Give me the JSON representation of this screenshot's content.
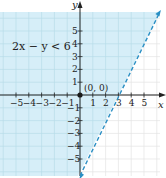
{
  "chart_data": {
    "type": "line",
    "title": "",
    "inequality_label": "2x − y < 6",
    "xlabel": "x",
    "ylabel": "y",
    "xlim": [
      -6,
      6
    ],
    "ylim": [
      -6,
      6
    ],
    "x_ticks": [
      -5,
      -4,
      -3,
      -2,
      -1,
      1,
      2,
      3,
      4,
      5
    ],
    "y_ticks": [
      -5,
      -4,
      -3,
      -2,
      -1,
      1,
      2,
      3,
      4,
      5
    ],
    "x_tick_labels": [
      "−5",
      "−4",
      "−3",
      "−2",
      "−1",
      "1",
      "2",
      "3",
      "4",
      "5"
    ],
    "y_tick_labels": [
      "−5",
      "−4",
      "−3",
      "−2",
      "−1",
      "1",
      "2",
      "3",
      "4",
      "5"
    ],
    "grid": true,
    "boundary_line": {
      "equation": "y = 2x − 6",
      "style": "dashed",
      "points": [
        [
          0,
          -6
        ],
        [
          3,
          0
        ],
        [
          6,
          6
        ]
      ],
      "x_intercept": 3,
      "y_intercept": -6
    },
    "shaded_region": "left/above of line (2x − y < 6)",
    "test_point": {
      "label": "(0, 0)",
      "x": 0,
      "y": 0
    },
    "colors": {
      "shade": "#d6eef8",
      "grid": "#b8dcea",
      "grid_unshaded": "#e4e4e4",
      "line": "#2a8fc4",
      "axis": "#222222"
    }
  }
}
